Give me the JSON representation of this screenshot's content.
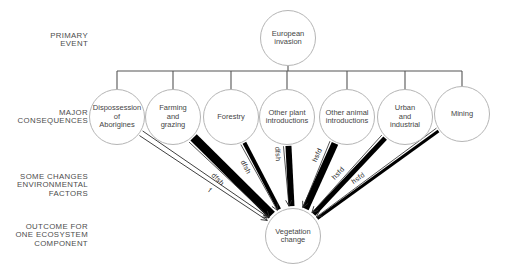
{
  "row_labels": [
    {
      "name": "primary-event",
      "text": "PRIMARY\nEVENT"
    },
    {
      "name": "major-consequences",
      "text": "MAJOR\nCONSEQUENCES"
    },
    {
      "name": "environmental-factors",
      "text": "SOME CHANGES\nENVIRONMENTAL\nFACTORS"
    },
    {
      "name": "outcome",
      "text": "OUTCOME FOR\nONE ECOSYSTEM\nCOMPONENT"
    }
  ],
  "nodes": {
    "primary": {
      "label": "European\ninvasion"
    },
    "outcome": {
      "label": "Vegetation\nchange"
    }
  },
  "consequences": [
    {
      "label": "Dispossession\nof\nAborigines",
      "arrow": {
        "style": "outline",
        "weight": 1,
        "label": "f"
      }
    },
    {
      "label": "Farming\nand\ngrazing",
      "arrow": {
        "style": "filled",
        "weight": 9,
        "label": "dfsh"
      }
    },
    {
      "label": "Forestry",
      "arrow": {
        "style": "filled",
        "weight": 4,
        "label": "dfsh"
      }
    },
    {
      "label": "Other plant\nintroductions",
      "arrow": {
        "style": "filled",
        "weight": 6,
        "label": "dfsh"
      }
    },
    {
      "label": "Other animal\nintroductions",
      "arrow": {
        "style": "filled",
        "weight": 7,
        "label": "hsfd"
      }
    },
    {
      "label": "Urban\nand\nindustrial",
      "arrow": {
        "style": "filled",
        "weight": 5,
        "label": "hsfd"
      }
    },
    {
      "label": "Mining",
      "arrow": {
        "style": "filled",
        "weight": 3,
        "label": "hsfd"
      }
    }
  ],
  "colors": {
    "bar": "#000000",
    "thin_line": "#2a2a2a",
    "tree_line": "#555555",
    "circle_border": "#b5b5b5",
    "text": "#454545"
  }
}
